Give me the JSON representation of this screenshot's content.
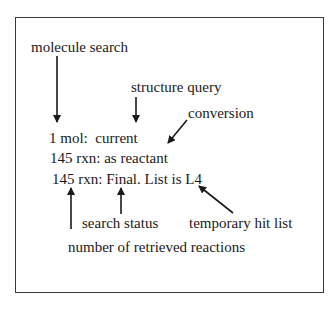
{
  "diagram": {
    "status_lines": [
      "1 mol:  current",
      "145 rxn: as reactant",
      "145 rxn: Final. List is L4"
    ],
    "annotations": {
      "molecule_search": "molecule search",
      "structure_query": "structure query",
      "conversion": "conversion",
      "search_status": "search status",
      "temporary_hit_list": "temporary hit list",
      "number_retrieved": "number of retrieved reactions"
    },
    "colors": {
      "text": "#1a1a1a",
      "border": "#3a3a3a",
      "background": "#ffffff"
    }
  }
}
